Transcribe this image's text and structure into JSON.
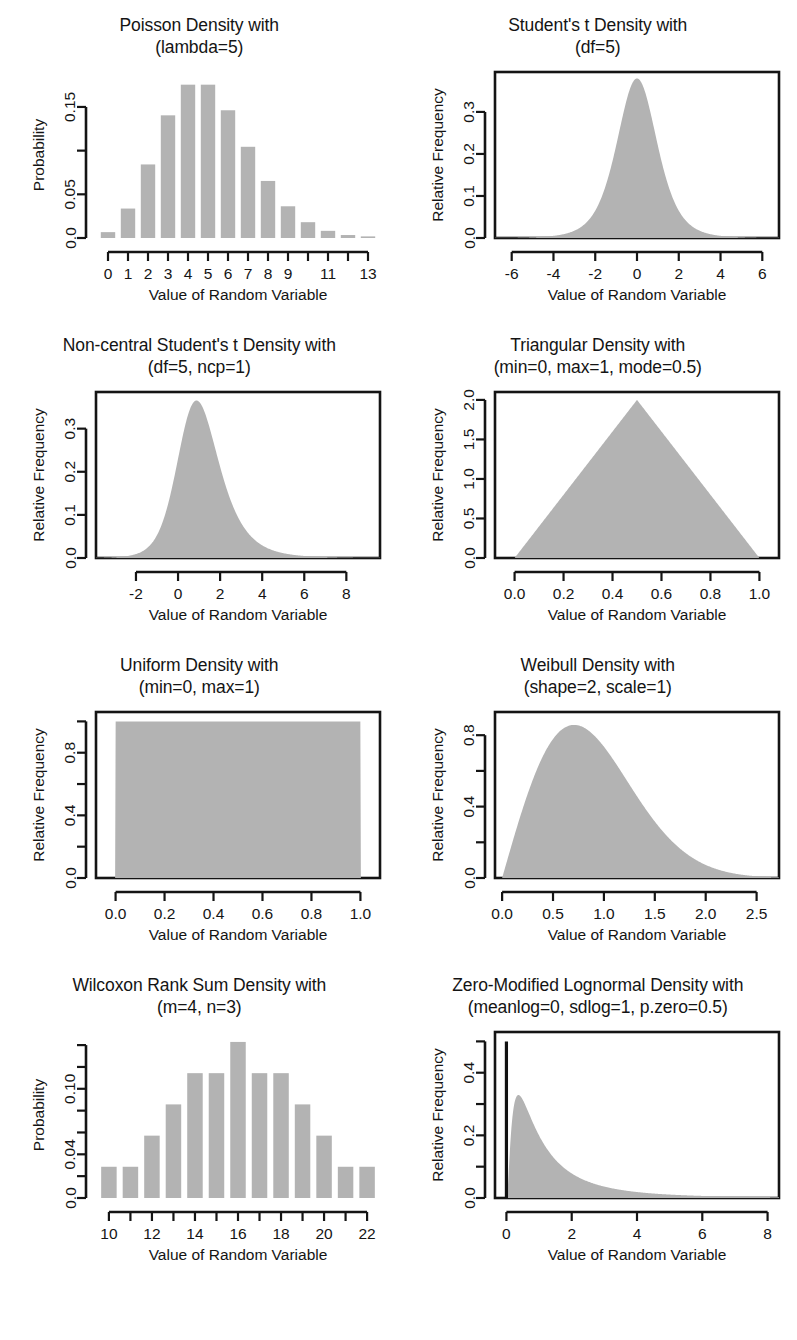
{
  "figure": {
    "axis_title": "Value of Random Variable",
    "fill_color": "#b3b3b3",
    "line_color": "#141414",
    "background": "#ffffff",
    "rows": 4,
    "cols": 2
  },
  "chart_data": [
    {
      "id": "poisson",
      "type": "bar",
      "title_line1": "Poisson Density with",
      "title_line2": "(lambda=5)",
      "xlabel": "Value of Random Variable",
      "ylabel": "Probability",
      "categories": [
        0,
        1,
        2,
        3,
        4,
        5,
        6,
        7,
        8,
        9,
        10,
        11,
        12,
        13
      ],
      "values": [
        0.0067,
        0.0337,
        0.0842,
        0.1404,
        0.1755,
        0.1755,
        0.1462,
        0.1044,
        0.0653,
        0.0363,
        0.0181,
        0.0082,
        0.0034,
        0.0013
      ],
      "xticks": [
        0,
        1,
        2,
        3,
        4,
        5,
        6,
        7,
        8,
        9,
        10,
        11,
        12,
        13
      ],
      "xticklabels": [
        "0",
        "1",
        "2",
        "3",
        "4",
        "5",
        "6",
        "7",
        "8",
        "9",
        "",
        "11",
        "",
        "13"
      ],
      "yticks": [
        0.0,
        0.05,
        0.1,
        0.15
      ],
      "yticklabels": [
        "0.0",
        "0.05",
        "",
        "0.15"
      ],
      "xlim": [
        -0.6,
        13.6
      ],
      "ylim": [
        0,
        0.19
      ],
      "grid": false,
      "box": false
    },
    {
      "id": "students-t",
      "type": "area",
      "title_line1": "Student's t Density with",
      "title_line2": "(df=5)",
      "xlabel": "Value of Random Variable",
      "ylabel": "Relative Frequency",
      "distribution": "t",
      "params": {
        "df": 5
      },
      "xticks": [
        -6,
        -4,
        -2,
        0,
        2,
        4,
        6
      ],
      "xticklabels": [
        "-6",
        "-4",
        "-2",
        "0",
        "2",
        "4",
        "6"
      ],
      "yticks": [
        0.0,
        0.1,
        0.2,
        0.3
      ],
      "yticklabels": [
        "0.0",
        "0.1",
        "0.2",
        "0.3"
      ],
      "xlim": [
        -6.8,
        6.8
      ],
      "ylim": [
        0,
        0.395
      ],
      "peak": 0.3796,
      "grid": false,
      "box": true
    },
    {
      "id": "non-central-students-t",
      "type": "area",
      "title_line1": "Non-central Student's t Density with",
      "title_line2": "(df=5, ncp=1)",
      "xlabel": "Value of Random Variable",
      "ylabel": "Relative Frequency",
      "distribution": "noncentral-t",
      "params": {
        "df": 5,
        "ncp": 1
      },
      "xticks": [
        -2,
        0,
        2,
        4,
        6,
        8
      ],
      "xticklabels": [
        "-2",
        "0",
        "2",
        "4",
        "6",
        "8"
      ],
      "yticks": [
        0.0,
        0.1,
        0.2,
        0.3
      ],
      "yticklabels": [
        "0.0",
        "0.1",
        "0.2",
        "0.3"
      ],
      "xlim": [
        -3.9,
        9.6
      ],
      "ylim": [
        0,
        0.385
      ],
      "peak": 0.356,
      "mode": 0.85,
      "grid": false,
      "box": true
    },
    {
      "id": "triangular",
      "type": "area",
      "title_line1": "Triangular Density with",
      "title_line2": "(min=0, max=1, mode=0.5)",
      "xlabel": "Value of Random Variable",
      "ylabel": "Relative Frequency",
      "distribution": "triangular",
      "params": {
        "min": 0,
        "max": 1,
        "mode": 0.5
      },
      "xticks": [
        0.0,
        0.2,
        0.4,
        0.6,
        0.8,
        1.0
      ],
      "xticklabels": [
        "0.0",
        "0.2",
        "0.4",
        "0.6",
        "0.8",
        "1.0"
      ],
      "yticks": [
        0.0,
        0.5,
        1.0,
        1.5,
        2.0
      ],
      "yticklabels": [
        "0.0",
        "0.5",
        "1.0",
        "1.5",
        "2.0"
      ],
      "xlim": [
        -0.08,
        1.08
      ],
      "ylim": [
        0,
        2.1
      ],
      "peak": 2.0,
      "grid": false,
      "box": true
    },
    {
      "id": "uniform",
      "type": "area",
      "title_line1": "Uniform Density with",
      "title_line2": "(min=0, max=1)",
      "xlabel": "Value of Random Variable",
      "ylabel": "Relative Frequency",
      "distribution": "uniform",
      "params": {
        "min": 0,
        "max": 1
      },
      "xticks": [
        0.0,
        0.2,
        0.4,
        0.6,
        0.8,
        1.0
      ],
      "xticklabels": [
        "0.0",
        "0.2",
        "0.4",
        "0.6",
        "0.8",
        "1.0"
      ],
      "yticks": [
        0.0,
        0.2,
        0.4,
        0.6,
        0.8,
        1.0
      ],
      "yticklabels": [
        "0.0",
        "",
        "0.4",
        "",
        "0.8",
        ""
      ],
      "xlim": [
        -0.08,
        1.08
      ],
      "ylim": [
        0,
        1.06
      ],
      "peak": 1.0,
      "grid": false,
      "box": true
    },
    {
      "id": "weibull",
      "type": "area",
      "title_line1": "Weibull Density with",
      "title_line2": "(shape=2, scale=1)",
      "xlabel": "Value of Random Variable",
      "ylabel": "Relative Frequency",
      "distribution": "weibull",
      "params": {
        "shape": 2,
        "scale": 1
      },
      "xticks": [
        0.0,
        0.5,
        1.0,
        1.5,
        2.0,
        2.5
      ],
      "xticklabels": [
        "0.0",
        "0.5",
        "1.0",
        "1.5",
        "2.0",
        "2.5"
      ],
      "yticks": [
        0.0,
        0.2,
        0.4,
        0.6,
        0.8
      ],
      "yticklabels": [
        "0.0",
        "",
        "0.4",
        "",
        "0.8"
      ],
      "xlim": [
        -0.07,
        2.72
      ],
      "ylim": [
        0,
        0.93
      ],
      "peak": 0.8578,
      "mode": 0.707,
      "grid": false,
      "box": true
    },
    {
      "id": "wilcoxon-rank-sum",
      "type": "bar",
      "title_line1": "Wilcoxon Rank Sum Density with",
      "title_line2": "(m=4, n=3)",
      "xlabel": "Value of Random Variable",
      "ylabel": "Probability",
      "categories": [
        10,
        11,
        12,
        13,
        14,
        15,
        16,
        17,
        18,
        19,
        20,
        21,
        22
      ],
      "values": [
        0.0286,
        0.0286,
        0.0571,
        0.0857,
        0.1143,
        0.1143,
        0.1429,
        0.1143,
        0.1143,
        0.0857,
        0.0571,
        0.0286,
        0.0286
      ],
      "xticks": [
        10,
        11,
        12,
        13,
        14,
        15,
        16,
        17,
        18,
        19,
        20,
        21,
        22
      ],
      "xticklabels": [
        "10",
        "",
        "12",
        "",
        "14",
        "",
        "16",
        "",
        "18",
        "",
        "20",
        "",
        "22"
      ],
      "yticks": [
        0.0,
        0.02,
        0.04,
        0.06,
        0.08,
        0.1,
        0.12,
        0.14
      ],
      "yticklabels": [
        "0.0",
        "",
        "0.04",
        "",
        "",
        "0.10",
        "",
        ""
      ],
      "xlim": [
        9.4,
        22.6
      ],
      "ylim": [
        0,
        0.152
      ],
      "grid": false,
      "box": false
    },
    {
      "id": "zero-modified-lognormal",
      "type": "area",
      "title_line1": "Zero-Modified Lognormal Density with",
      "title_line2": "(meanlog=0, sdlog=1, p.zero=0.5)",
      "xlabel": "Value of Random Variable",
      "ylabel": "Relative Frequency",
      "distribution": "zero-modified-lognormal",
      "params": {
        "meanlog": 0,
        "sdlog": 1,
        "p.zero": 0.5
      },
      "xticks": [
        0,
        2,
        4,
        6,
        8
      ],
      "xticklabels": [
        "0",
        "2",
        "4",
        "6",
        "8"
      ],
      "yticks": [
        0.0,
        0.1,
        0.2,
        0.3,
        0.4,
        0.5
      ],
      "yticklabels": [
        "0.0",
        "",
        "0.2",
        "",
        "0.4",
        ""
      ],
      "xlim": [
        -0.35,
        8.35
      ],
      "ylim": [
        0,
        0.53
      ],
      "spike_at": 0,
      "spike_height": 0.5,
      "peak": 0.3214,
      "grid": false,
      "box": true
    }
  ]
}
